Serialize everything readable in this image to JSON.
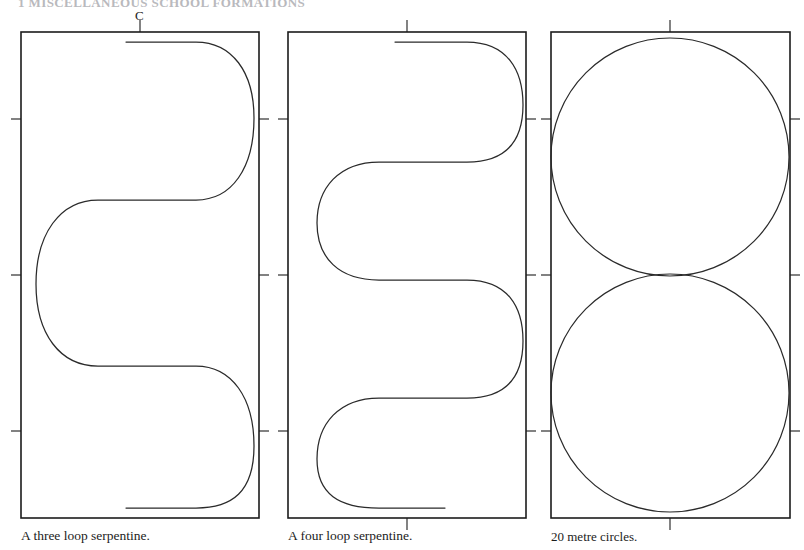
{
  "page": {
    "running_header": "1  MISCELLANEOUS SCHOOL FORMATIONS",
    "background_color": "#ffffff",
    "ink_color": "#1c1c1c",
    "width": 804,
    "height": 550
  },
  "figures": [
    {
      "id": "three-loop-serpentine",
      "caption": "A three loop serpentine.",
      "marker_label": "C",
      "arena": {
        "x": 21,
        "y": 32,
        "width": 238,
        "height": 486,
        "top_ticks": [
          0.5
        ],
        "bottom_ticks": [],
        "left_ticks": [
          0.18,
          0.5,
          0.82
        ],
        "right_ticks": [
          0.18,
          0.5,
          0.82
        ]
      },
      "track": {
        "type": "serpentine",
        "loops": 3,
        "loop_diameter_fraction": 0.62,
        "description": "Three half-circle loops alternating left and right across the arena, entered at C on the centre line."
      }
    },
    {
      "id": "four-loop-serpentine",
      "caption": "A four loop serpentine.",
      "marker_label": "",
      "arena": {
        "x": 288,
        "y": 32,
        "width": 238,
        "height": 486,
        "top_ticks": [
          0.5
        ],
        "bottom_ticks": [
          0.5
        ],
        "left_ticks": [
          0.18,
          0.5,
          0.82
        ],
        "right_ticks": [
          0.18,
          0.5,
          0.82
        ]
      },
      "track": {
        "type": "serpentine",
        "loops": 4,
        "loop_diameter_fraction": 0.46,
        "description": "Four half-circle loops alternating left and right across the arena."
      }
    },
    {
      "id": "twenty-metre-circles",
      "caption": "20 metre circles.",
      "marker_label": "",
      "arena": {
        "x": 551,
        "y": 32,
        "width": 239,
        "height": 486,
        "top_ticks": [
          0.5
        ],
        "bottom_ticks": [
          0.5
        ],
        "left_ticks": [
          0.18,
          0.5,
          0.82
        ],
        "right_ticks": [
          0.18,
          0.5,
          0.82
        ]
      },
      "track": {
        "type": "circles",
        "count": 2,
        "diameter_metres": 20,
        "circle_centres": [
          0.27,
          0.73
        ],
        "radius_fraction": 0.245,
        "description": "Two 20 metre circles, tangent to one another at the centre of the arena."
      }
    }
  ],
  "captions": {
    "left": "A three loop serpentine.",
    "middle": "A four loop serpentine.",
    "right": "20 metre circles."
  }
}
